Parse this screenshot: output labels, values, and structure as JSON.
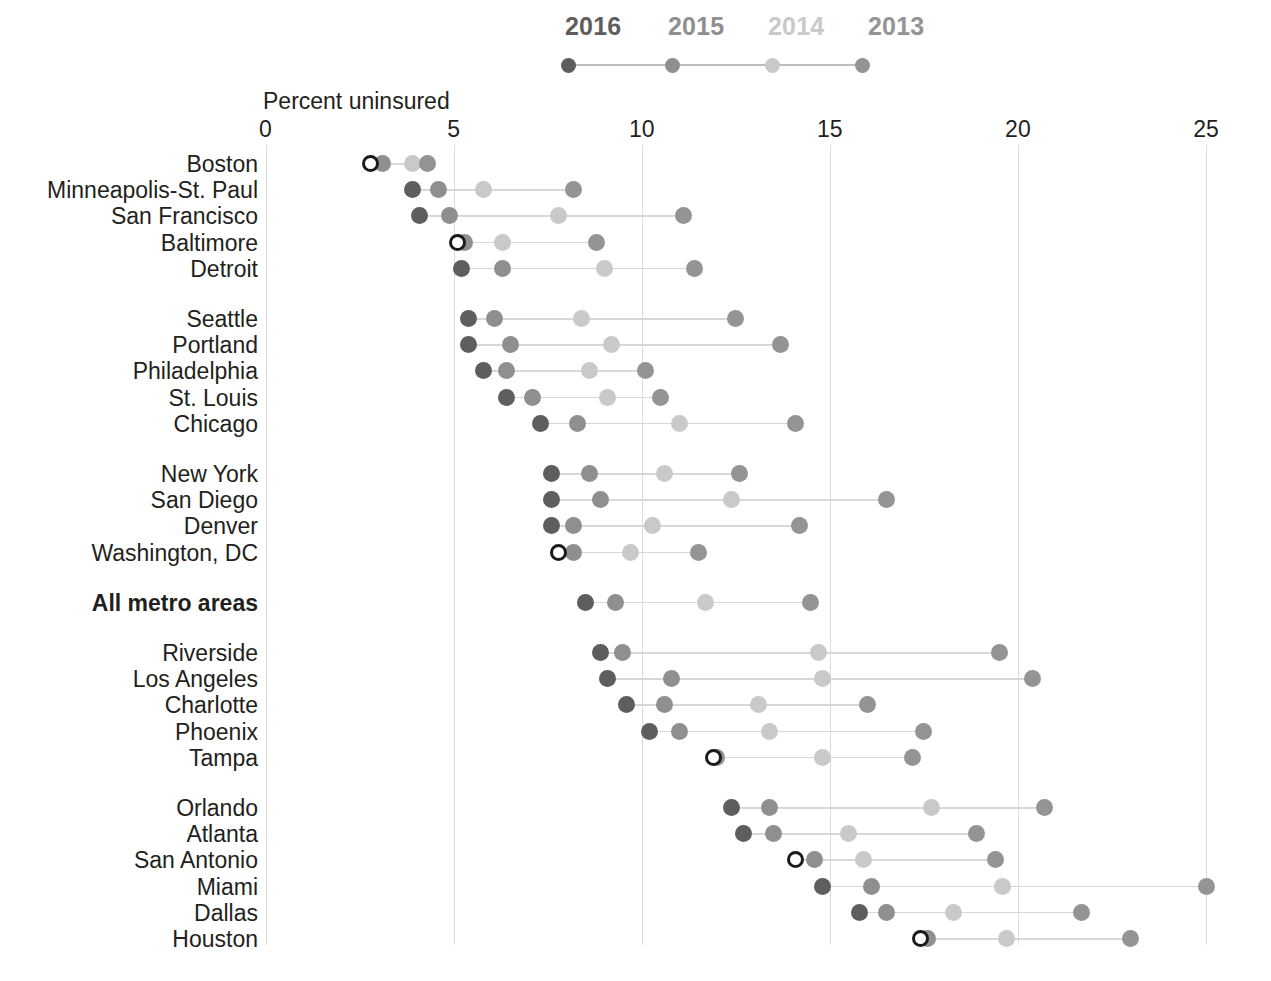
{
  "chart_data": {
    "type": "scatter",
    "title": "",
    "xlabel": "Percent uninsured",
    "ylabel": "",
    "xlim": [
      0,
      25.8
    ],
    "xticks": [
      0,
      5,
      10,
      15,
      20,
      25
    ],
    "xtick_labels": [
      "0",
      "5",
      "10",
      "15",
      "20",
      "25"
    ],
    "grid": true,
    "legend_position": "top",
    "series": [
      {
        "name": "2016",
        "color": "#5e5e5e"
      },
      {
        "name": "2015",
        "color": "#8f8f8f"
      },
      {
        "name": "2014",
        "color": "#c9c9c9"
      },
      {
        "name": "2013",
        "color": "#949494"
      }
    ],
    "categories": [
      "Boston",
      "Minneapolis-St. Paul",
      "San Francisco",
      "Baltimore",
      "Detroit",
      "Seattle",
      "Portland",
      "Philadelphia",
      "St. Louis",
      "Chicago",
      "New York",
      "San Diego",
      "Denver",
      "Washington, DC",
      "All metro areas",
      "Riverside",
      "Los Angeles",
      "Charlotte",
      "Phoenix",
      "Tampa",
      "Orlando",
      "Atlanta",
      "San Antonio",
      "Miami",
      "Dallas",
      "Houston"
    ],
    "rows": [
      {
        "label": "Boston",
        "group": 0,
        "emphasis": false,
        "highlight_2016": true,
        "values": {
          "2016": 2.8,
          "2015": 3.1,
          "2014": 3.9,
          "2013": 4.3
        }
      },
      {
        "label": "Minneapolis-St. Paul",
        "group": 0,
        "emphasis": false,
        "highlight_2016": false,
        "values": {
          "2016": 3.9,
          "2015": 4.6,
          "2014": 5.8,
          "2013": 8.2
        }
      },
      {
        "label": "San Francisco",
        "group": 0,
        "emphasis": false,
        "highlight_2016": false,
        "values": {
          "2016": 4.1,
          "2015": 4.9,
          "2014": 7.8,
          "2013": 11.1
        }
      },
      {
        "label": "Baltimore",
        "group": 0,
        "emphasis": false,
        "highlight_2016": true,
        "values": {
          "2016": 5.1,
          "2015": 5.3,
          "2014": 6.3,
          "2013": 8.8
        }
      },
      {
        "label": "Detroit",
        "group": 0,
        "emphasis": false,
        "highlight_2016": false,
        "values": {
          "2016": 5.2,
          "2015": 6.3,
          "2014": 9.0,
          "2013": 11.4
        }
      },
      {
        "label": "Seattle",
        "group": 1,
        "emphasis": false,
        "highlight_2016": false,
        "values": {
          "2016": 5.4,
          "2015": 6.1,
          "2014": 8.4,
          "2013": 12.5
        }
      },
      {
        "label": "Portland",
        "group": 1,
        "emphasis": false,
        "highlight_2016": false,
        "values": {
          "2016": 5.4,
          "2015": 6.5,
          "2014": 9.2,
          "2013": 13.7
        }
      },
      {
        "label": "Philadelphia",
        "group": 1,
        "emphasis": false,
        "highlight_2016": false,
        "values": {
          "2016": 5.8,
          "2015": 6.4,
          "2014": 8.6,
          "2013": 10.1
        }
      },
      {
        "label": "St. Louis",
        "group": 1,
        "emphasis": false,
        "highlight_2016": false,
        "values": {
          "2016": 6.4,
          "2015": 7.1,
          "2014": 9.1,
          "2013": 10.5
        }
      },
      {
        "label": "Chicago",
        "group": 1,
        "emphasis": false,
        "highlight_2016": false,
        "values": {
          "2016": 7.3,
          "2015": 8.3,
          "2014": 11.0,
          "2013": 14.1
        }
      },
      {
        "label": "New York",
        "group": 2,
        "emphasis": false,
        "highlight_2016": false,
        "values": {
          "2016": 7.6,
          "2015": 8.6,
          "2014": 10.6,
          "2013": 12.6
        }
      },
      {
        "label": "San Diego",
        "group": 2,
        "emphasis": false,
        "highlight_2016": false,
        "values": {
          "2016": 7.6,
          "2015": 8.9,
          "2014": 12.4,
          "2013": 16.5
        }
      },
      {
        "label": "Denver",
        "group": 2,
        "emphasis": false,
        "highlight_2016": false,
        "values": {
          "2016": 7.6,
          "2015": 8.2,
          "2014": 10.3,
          "2013": 14.2
        }
      },
      {
        "label": "Washington, DC",
        "group": 2,
        "emphasis": false,
        "highlight_2016": true,
        "values": {
          "2016": 7.8,
          "2015": 8.2,
          "2014": 9.7,
          "2013": 11.5
        }
      },
      {
        "label": "All metro areas",
        "group": 3,
        "emphasis": true,
        "highlight_2016": false,
        "values": {
          "2016": 8.5,
          "2015": 9.3,
          "2014": 11.7,
          "2013": 14.5
        }
      },
      {
        "label": "Riverside",
        "group": 4,
        "emphasis": false,
        "highlight_2016": false,
        "values": {
          "2016": 8.9,
          "2015": 9.5,
          "2014": 14.7,
          "2013": 19.5
        }
      },
      {
        "label": "Los Angeles",
        "group": 4,
        "emphasis": false,
        "highlight_2016": false,
        "values": {
          "2016": 9.1,
          "2015": 10.8,
          "2014": 14.8,
          "2013": 20.4
        }
      },
      {
        "label": "Charlotte",
        "group": 4,
        "emphasis": false,
        "highlight_2016": false,
        "values": {
          "2016": 9.6,
          "2015": 10.6,
          "2014": 13.1,
          "2013": 16.0
        }
      },
      {
        "label": "Phoenix",
        "group": 4,
        "emphasis": false,
        "highlight_2016": false,
        "values": {
          "2016": 10.2,
          "2015": 11.0,
          "2014": 13.4,
          "2013": 17.5
        }
      },
      {
        "label": "Tampa",
        "group": 4,
        "emphasis": false,
        "highlight_2016": true,
        "values": {
          "2016": 11.9,
          "2015": 12.0,
          "2014": 14.8,
          "2013": 17.2
        }
      },
      {
        "label": "Orlando",
        "group": 5,
        "emphasis": false,
        "highlight_2016": false,
        "values": {
          "2016": 12.4,
          "2015": 13.4,
          "2014": 17.7,
          "2013": 20.7
        }
      },
      {
        "label": "Atlanta",
        "group": 5,
        "emphasis": false,
        "highlight_2016": false,
        "values": {
          "2016": 12.7,
          "2015": 13.5,
          "2014": 15.5,
          "2013": 18.9
        }
      },
      {
        "label": "San Antonio",
        "group": 5,
        "emphasis": false,
        "highlight_2016": true,
        "values": {
          "2016": 14.1,
          "2015": 14.6,
          "2014": 15.9,
          "2013": 19.4
        }
      },
      {
        "label": "Miami",
        "group": 5,
        "emphasis": false,
        "highlight_2016": false,
        "values": {
          "2016": 14.8,
          "2015": 16.1,
          "2014": 19.6,
          "2013": 25.0
        }
      },
      {
        "label": "Dallas",
        "group": 5,
        "emphasis": false,
        "highlight_2016": false,
        "values": {
          "2016": 15.8,
          "2015": 16.5,
          "2014": 18.3,
          "2013": 21.7
        }
      },
      {
        "label": "Houston",
        "group": 5,
        "emphasis": false,
        "highlight_2016": true,
        "values": {
          "2016": 17.4,
          "2015": 17.6,
          "2014": 19.7,
          "2013": 23.0
        }
      }
    ]
  },
  "legend": {
    "items": [
      {
        "label": "2016",
        "color": "#5e5e5e"
      },
      {
        "label": "2015",
        "color": "#8f8f8f"
      },
      {
        "label": "2014",
        "color": "#c9c9c9"
      },
      {
        "label": "2013",
        "color": "#949494"
      }
    ]
  },
  "axis": {
    "title": "Percent uninsured",
    "ticks": [
      "0",
      "5",
      "10",
      "15",
      "20",
      "25"
    ]
  },
  "colors": {
    "year_2016": "#5e5e5e",
    "year_2015": "#8f8f8f",
    "year_2014": "#c9c9c9",
    "year_2013": "#949494",
    "gridline": "#dcdcdc",
    "connector": "#d8d8d8",
    "text": "#231f20",
    "background": "#ffffff"
  }
}
